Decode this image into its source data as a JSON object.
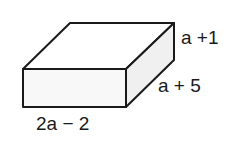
{
  "diagram": {
    "type": "rectangular-prism",
    "stroke_color": "#1a1a1a",
    "front_fill": "#f8f8f8",
    "side_fill": "#f0f0f0",
    "top_fill": "#ffffff",
    "labels": {
      "height": "a +1",
      "depth": "a + 5",
      "width": "2a − 2"
    }
  }
}
